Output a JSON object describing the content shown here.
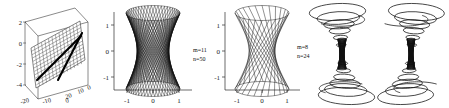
{
  "figure": {
    "panel_count": 5,
    "background": "#ffffff",
    "ink": "#000000"
  },
  "panels": [
    {
      "id": "panel-1",
      "name": "three-dimensional-plane-plot",
      "type": "3d-surface-mesh",
      "description": "3D box axes containing a tilted gridded plane with two thick straight line segments drawn on it",
      "axes": {
        "x_ticks": [
          "-20",
          "-10",
          "0"
        ],
        "depth_ticks": [
          "20",
          "10",
          "0"
        ],
        "y_ticks": [
          "2",
          "0",
          "-2",
          "-4"
        ]
      },
      "annotation": ""
    },
    {
      "id": "panel-2",
      "name": "hyperboloid-double-ruling-plot",
      "type": "ruled-surface",
      "description": "Hyperboloid of one sheet rendered as a dense crossing double ruling (diamond lattice)",
      "axes": {
        "x_ticks": [
          "-1",
          "0",
          "1"
        ],
        "y_ticks": [
          "1",
          "0",
          "-1"
        ],
        "xlim": [
          -1.35,
          1.35
        ],
        "ylim": [
          -1.35,
          1.35
        ]
      },
      "annotation": {
        "m_label": "m=11",
        "n_label": "n=50",
        "m": 11,
        "n": 50
      }
    },
    {
      "id": "panel-3",
      "name": "hyperboloid-single-ruling-plot",
      "type": "ruled-surface",
      "description": "Hyperboloid of one sheet rendered as a single family of straight rulings",
      "axes": {
        "x_ticks": [
          "-1",
          "0",
          "1"
        ],
        "y_ticks": [
          "1",
          "0",
          "-1"
        ],
        "xlim": [
          -1.35,
          1.35
        ],
        "ylim": [
          -1.35,
          1.35
        ]
      },
      "annotation": {
        "m_label": "m=8",
        "n_label": "n=24",
        "m": 8,
        "n": 24
      }
    },
    {
      "id": "panel-4",
      "name": "vortex-funnel-plot-left",
      "type": "spiral-surface",
      "description": "Axis-free hourglass/vortex surface: concentric spiral rings flaring at top and bottom with a twisted narrow waist",
      "axes": null,
      "annotation": ""
    },
    {
      "id": "panel-5",
      "name": "vortex-funnel-plot-right",
      "type": "spiral-surface",
      "description": "Second axis-free hourglass/vortex surface viewed from a slightly rotated angle",
      "axes": null,
      "annotation": ""
    }
  ],
  "chart_data": {
    "type": "line",
    "title": "",
    "subtitle": "",
    "xlabel": "",
    "ylabel": "",
    "panels": [
      {
        "label": "3D plane with generating lines",
        "xlim": [
          -25,
          25
        ],
        "ylim": [
          -4.5,
          3
        ],
        "xticks": [
          -20,
          -10,
          0
        ],
        "depthticks": [
          0,
          10,
          20
        ],
        "yticks": [
          -4,
          -2,
          0,
          2
        ]
      },
      {
        "label": "hyperboloid m=11 n=50",
        "m": 11,
        "n": 50,
        "xlim": [
          -1.35,
          1.35
        ],
        "ylim": [
          -1.35,
          1.35
        ],
        "xticks": [
          -1,
          0,
          1
        ],
        "yticks": [
          -1,
          0,
          1
        ]
      },
      {
        "label": "hyperboloid m=8 n=24",
        "m": 8,
        "n": 24,
        "xlim": [
          -1.35,
          1.35
        ],
        "ylim": [
          -1.35,
          1.35
        ],
        "xticks": [
          -1,
          0,
          1
        ],
        "yticks": [
          -1,
          0,
          1
        ]
      },
      {
        "label": "vortex funnel left",
        "xlim": null,
        "ylim": null
      },
      {
        "label": "vortex funnel right",
        "xlim": null,
        "ylim": null
      }
    ],
    "legend": [],
    "grid": false
  }
}
